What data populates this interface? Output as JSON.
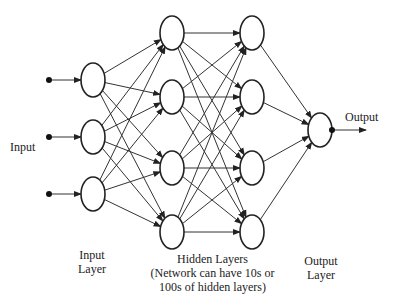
{
  "diagram": {
    "type": "neural-network",
    "labels": {
      "input": "Input",
      "output": "Output",
      "input_layer_line1": "Input",
      "input_layer_line2": "Layer",
      "hidden_line1": "Hidden Layers",
      "hidden_line2": "(Network can have 10s or",
      "hidden_line3": "100s of hidden layers)",
      "output_layer_line1": "Output",
      "output_layer_line2": "Layer"
    },
    "layers": [
      {
        "name": "input",
        "nodes": 3
      },
      {
        "name": "hidden-1",
        "nodes": 4
      },
      {
        "name": "hidden-2",
        "nodes": 4
      },
      {
        "name": "output",
        "nodes": 1
      }
    ],
    "stroke_color": "#222222"
  }
}
